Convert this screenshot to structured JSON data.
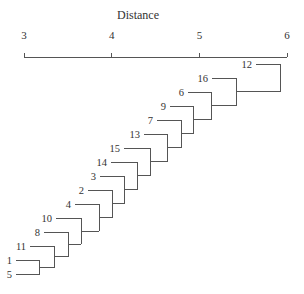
{
  "chart_data": {
    "type": "dendrogram",
    "title": "",
    "xlabel": "Distance",
    "ylabel": "",
    "axis_position": "top",
    "xlim": [
      3,
      6
    ],
    "ticks": [
      3,
      4,
      5,
      6
    ],
    "tick_labels": [
      "3",
      "4",
      "5",
      "6"
    ],
    "grid": false,
    "legend": null,
    "leaves_top_to_bottom": [
      "12",
      "16",
      "6",
      "9",
      "7",
      "13",
      "15",
      "14",
      "3",
      "2",
      "4",
      "10",
      "8",
      "11",
      "1",
      "5"
    ],
    "merges": [
      {
        "join": [
          "1",
          "5"
        ],
        "distance": 3.18
      },
      {
        "join": [
          "(1,5)",
          "11"
        ],
        "distance": 3.35
      },
      {
        "join": [
          "prev",
          "8"
        ],
        "distance": 3.51
      },
      {
        "join": [
          "prev",
          "10"
        ],
        "distance": 3.65
      },
      {
        "join": [
          "prev",
          "4"
        ],
        "distance": 3.86
      },
      {
        "join": [
          "prev",
          "2"
        ],
        "distance": 4.01
      },
      {
        "join": [
          "prev",
          "3"
        ],
        "distance": 4.15
      },
      {
        "join": [
          "prev",
          "14"
        ],
        "distance": 4.29
      },
      {
        "join": [
          "prev",
          "15"
        ],
        "distance": 4.44
      },
      {
        "join": [
          "prev",
          "13"
        ],
        "distance": 4.64
      },
      {
        "join": [
          "prev",
          "7"
        ],
        "distance": 4.8
      },
      {
        "join": [
          "prev",
          "9"
        ],
        "distance": 4.93
      },
      {
        "join": [
          "prev",
          "6"
        ],
        "distance": 5.14
      },
      {
        "join": [
          "prev",
          "16"
        ],
        "distance": 5.42
      },
      {
        "join": [
          "prev",
          "12"
        ],
        "distance": 5.93
      }
    ]
  },
  "layout": {
    "x0_px": 24,
    "px_per_unit": 87.7,
    "axis_y": 57,
    "title_y": 19,
    "tick_label_y": 39,
    "row_top_y": 64,
    "row_bottom_y": 274,
    "leaf_line_offsets": {
      "12": 256,
      "16": 212,
      "6": 188,
      "9": 170,
      "7": 157,
      "13": 144,
      "15": 124,
      "14": 111,
      "3": 100,
      "2": 88,
      "4": 75,
      "10": 56,
      "8": 44,
      "11": 30,
      "1": 16,
      "5": 16
    },
    "line_color": "#555555",
    "text_color": "#333333"
  }
}
